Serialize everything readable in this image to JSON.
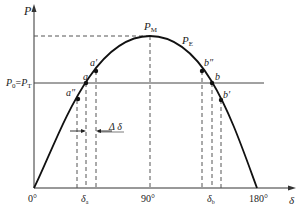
{
  "diagram": {
    "axes": {
      "y_label": "P",
      "x_label": "δ",
      "x_ticks": [
        "0°",
        "90°",
        "180°"
      ]
    },
    "curve_label": "P",
    "curve_label_sub": "E",
    "peak_label": "P",
    "peak_label_sub": "M",
    "load_line_label": {
      "p0": "P",
      "p0_sub": "0",
      "eq": "=",
      "pt": "P",
      "pt_sub": "T"
    },
    "points": {
      "a": "a",
      "a_prime": "a′",
      "a_double_prime": "a″",
      "b": "b",
      "b_prime": "b′",
      "b_double_prime": "b″"
    },
    "angle_labels": {
      "delta_a": "δ",
      "delta_a_sub": "a",
      "delta_b": "δ",
      "delta_b_sub": "b",
      "delta_increment": "Δ δ"
    },
    "colors": {
      "curve": "#111111",
      "axis": "#333333",
      "dashed": "#555555",
      "load_line": "#444444"
    }
  }
}
